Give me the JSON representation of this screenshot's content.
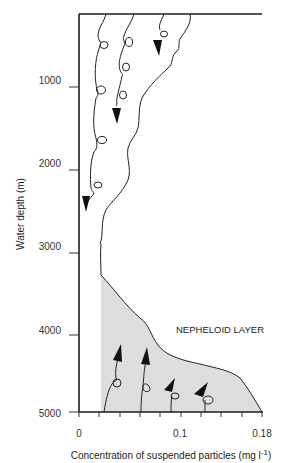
{
  "diagram": {
    "annotation": "NEPHELOID LAYER",
    "y_axis": {
      "title": "Water depth (m)",
      "ticks": [
        "1000",
        "2000",
        "3000",
        "4000",
        "5000"
      ]
    },
    "x_axis": {
      "title": "Concentration of suspended particles  (mg l",
      "title_superscript": "-1",
      "title_close": ")",
      "ticks": [
        "0",
        "0.1",
        "0.18"
      ]
    },
    "colors": {
      "axis": "#1a1a1a",
      "line": "#222222",
      "nepheloid_fill": "#dedede",
      "arrow": "#111111"
    },
    "description": {
      "upper_paths": "Particles sinking from surface downward with looping trajectories (arrows pointing down)",
      "lower_paths": "Particles resuspended upward from the sea floor within the nepheloid layer (arrows pointing up)"
    }
  }
}
